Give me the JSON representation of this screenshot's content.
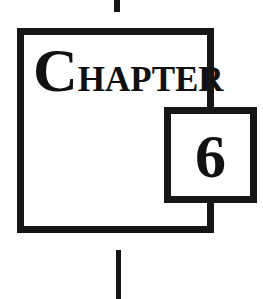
{
  "chapter": {
    "label_initial": "C",
    "label_rest": "HAPTER",
    "number": "6"
  },
  "colors": {
    "ink": "#161616",
    "background": "#ffffff"
  }
}
